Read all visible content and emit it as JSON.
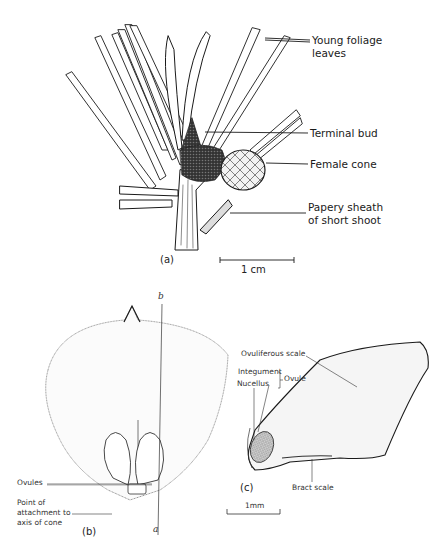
{
  "figure_a": {
    "panel_label": "(a)",
    "labels": {
      "young_foliage_1": "Young foliage",
      "young_foliage_2": "leaves",
      "terminal_bud": "Terminal bud",
      "female_cone": "Female cone",
      "papery_sheath_1": "Papery sheath",
      "papery_sheath_2": "of short shoot"
    },
    "scale_bar": "1 cm"
  },
  "figure_b": {
    "panel_label": "(b)",
    "axis_top": "b",
    "axis_bottom": "a",
    "labels": {
      "ovules": "Ovules",
      "attach_1": "Point of",
      "attach_2": "attachment to",
      "attach_3": "axis of cone"
    }
  },
  "figure_c": {
    "panel_label": "(c)",
    "labels": {
      "ovuliferous_scale": "Ovuliferous scale",
      "integument": "Integument",
      "nucellus": "Nucellus",
      "ovule": "Ovule",
      "bract_scale": "Bract scale"
    },
    "scale_bar": "1mm"
  },
  "colors": {
    "ink": "#1a1a1a",
    "stipple": "#e8e8e8",
    "nucellus_fill": "#bdbdbd"
  }
}
